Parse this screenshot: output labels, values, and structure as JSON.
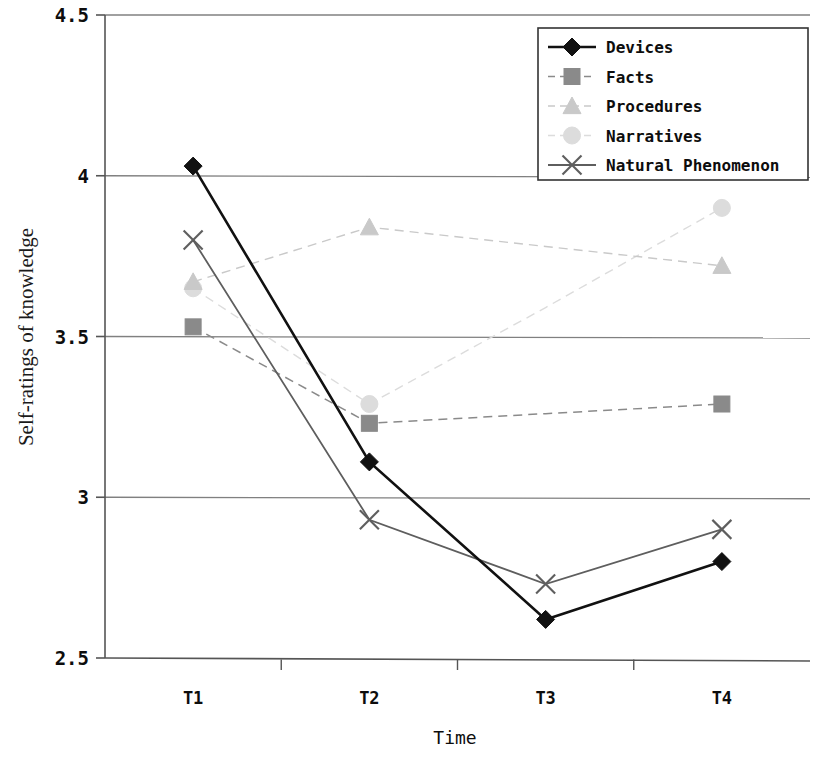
{
  "chart_data": {
    "type": "line",
    "title": "",
    "xlabel": "Time",
    "ylabel": "Self-ratings of knowledge",
    "categories": [
      "T1",
      "T2",
      "T3",
      "T4"
    ],
    "ylim": [
      2.5,
      4.5
    ],
    "yticks": [
      "2.5",
      "3",
      "3.5",
      "4",
      "4.5"
    ],
    "ytick_values": [
      2.5,
      3,
      3.5,
      4,
      4.5
    ],
    "grid": "horizontal",
    "legend_position": "top-right",
    "series": [
      {
        "name": "Devices",
        "values": [
          4.03,
          3.11,
          2.62,
          2.8
        ],
        "color": "#111111",
        "marker": "diamond",
        "line_style": "solid",
        "line_width": 2.6,
        "markers_shown": [
          true,
          true,
          true,
          true
        ]
      },
      {
        "name": "Facts",
        "values": [
          3.53,
          3.23,
          3.26,
          3.29
        ],
        "color": "#8a8a8a",
        "marker": "square",
        "line_style": "dashed",
        "line_width": 1.5,
        "markers_shown": [
          true,
          true,
          false,
          true
        ]
      },
      {
        "name": "Procedures",
        "values": [
          3.67,
          3.84,
          3.78,
          3.72
        ],
        "color": "#c9c9c9",
        "marker": "triangle",
        "line_style": "dashed",
        "line_width": 1.4,
        "markers_shown": [
          true,
          true,
          false,
          true
        ]
      },
      {
        "name": "Narratives",
        "values": [
          3.65,
          3.29,
          3.59,
          3.9
        ],
        "color": "#dcdcdc",
        "marker": "circle",
        "line_style": "dashed",
        "line_width": 1.4,
        "markers_shown": [
          true,
          true,
          false,
          true
        ]
      },
      {
        "name": "Natural Phenomenon",
        "values": [
          3.8,
          2.93,
          2.73,
          2.9
        ],
        "color": "#5e5e5e",
        "marker": "cross",
        "line_style": "solid",
        "line_width": 1.8,
        "markers_shown": [
          true,
          true,
          true,
          true
        ]
      }
    ]
  },
  "legend": {
    "items": [
      "Devices",
      "Facts",
      "Procedures",
      "Narratives",
      "Natural Phenomenon"
    ],
    "border_color": "#333333",
    "background": "#ffffff"
  },
  "axes": {
    "axis_color": "#555555",
    "grid_color": "#808080"
  }
}
